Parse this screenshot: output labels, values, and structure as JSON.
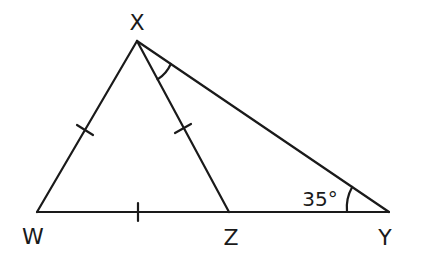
{
  "diagram": {
    "type": "triangle",
    "stroke_color": "#1a1a1a",
    "points": {
      "X": {
        "label": "X",
        "x": 137,
        "y": 41
      },
      "W": {
        "label": "W",
        "x": 37,
        "y": 212
      },
      "Z": {
        "label": "Z",
        "x": 229,
        "y": 212
      },
      "Y": {
        "label": "Y",
        "x": 389,
        "y": 212
      }
    },
    "segments": [
      "XW",
      "XZ",
      "XY",
      "WY"
    ],
    "congruent_marks": [
      "XW",
      "XZ",
      "WZ"
    ],
    "angle_marks": [
      {
        "vertex": "X",
        "between": [
          "XZ",
          "XY"
        ],
        "label": ""
      },
      {
        "vertex": "Y",
        "between": [
          "YX",
          "YW"
        ],
        "label": "35°"
      }
    ],
    "angle_Y_label": "35°"
  }
}
